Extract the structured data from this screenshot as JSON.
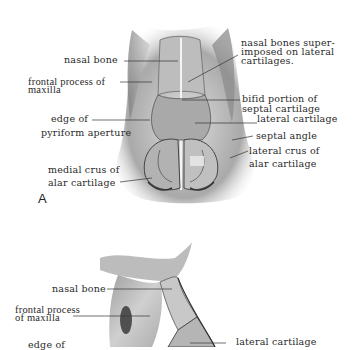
{
  "figure_a": {
    "letter": "A",
    "labels": {
      "nasal_bone": "nasal bone",
      "frontal_process_1": "frontal process of",
      "frontal_process_2": "maxilla",
      "edge_pyriform_1": "edge of",
      "edge_pyriform_2": "pyriform aperture",
      "medial_crus_1": "medial crus of",
      "medial_crus_2": "alar cartilage",
      "nasal_bones_super_1": "nasal bones super-",
      "nasal_bones_super_2": "imposed on lateral",
      "nasal_bones_super_3": "cartilages.",
      "bifid_1": "bifid portion of",
      "bifid_2": "septal cartilage",
      "lateral_cartilage": "lateral cartilage",
      "septal_angle": "septal angle",
      "lateral_crus_1": "lateral crus of",
      "lateral_crus_2": "alar cartilage"
    }
  },
  "figure_b": {
    "labels": {
      "nasal_bone": "nasal bone",
      "frontal_process_1": "frontal process",
      "frontal_process_2": "of maxilla",
      "edge_partial": "edge of",
      "lateral_cartilage": "lateral cartilage"
    }
  }
}
